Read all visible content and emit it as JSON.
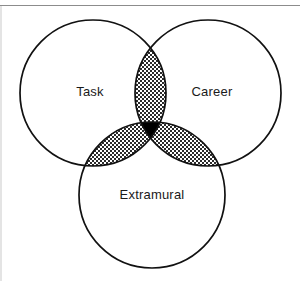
{
  "figure": {
    "type": "venn-diagram-3-set",
    "title": "",
    "background_color": "#ffffff",
    "outline_color": "#111111",
    "stipple_color": "#2b2b2b",
    "triple_intersection_color": "#000000",
    "frame_rule_color": "#8c8c8c",
    "frame_edge_color": "#c9c9c9"
  },
  "sets": [
    {
      "id": "task",
      "label": "Task",
      "label_x": 90,
      "label_y": 93,
      "center_x": 93,
      "center_y": 93,
      "radius": 73,
      "fill": "none"
    },
    {
      "id": "career",
      "label": "Career",
      "label_x": 212,
      "label_y": 93,
      "center_x": 208,
      "center_y": 93,
      "radius": 73,
      "fill": "none"
    },
    {
      "id": "extramural",
      "label": "Extramural",
      "label_x": 152,
      "label_y": 196,
      "center_x": 152,
      "center_y": 195,
      "radius": 73,
      "fill": "none"
    }
  ],
  "regions": [
    {
      "id": "task-career",
      "label": "",
      "fill_style": "stipple",
      "sets": [
        "task",
        "career"
      ]
    },
    {
      "id": "task-extramural",
      "label": "",
      "fill_style": "stipple",
      "sets": [
        "task",
        "extramural"
      ]
    },
    {
      "id": "career-extramural",
      "label": "",
      "fill_style": "stipple",
      "sets": [
        "career",
        "extramural"
      ]
    },
    {
      "id": "task-career-extramural",
      "label": "",
      "fill_style": "solid-black",
      "sets": [
        "task",
        "career",
        "extramural"
      ]
    }
  ],
  "frame": {
    "top_rule_y": 5,
    "left_edge_x": 1,
    "has_top_rule": true,
    "has_left_edge": true
  }
}
